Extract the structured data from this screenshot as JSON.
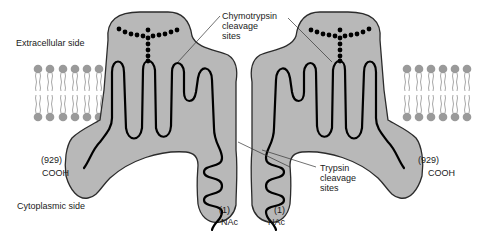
{
  "figure": {
    "labels": {
      "extracellular": "Extracellular side",
      "cytoplasmic": "Cytoplasmic side",
      "chymotrypsin_line1": "Chymotrypsin",
      "chymotrypsin_line2": "cleavage",
      "chymotrypsin_line3": "sites",
      "trypsin_line1": "Trypsin",
      "trypsin_line2": "cleavage",
      "trypsin_line3": "sites"
    },
    "left_protein": {
      "c_terminus_number": "(929)",
      "c_terminus": "COOH",
      "n_terminus_number": "(1)",
      "n_terminus": "NAc"
    },
    "right_protein": {
      "c_terminus_number": "(929)",
      "c_terminus": "COOH",
      "n_terminus_number": "(1)",
      "n_terminus": "NAc"
    },
    "membrane": {
      "left_lipid_count": 6,
      "right_lipid_count": 6
    },
    "colors": {
      "protein_fill": "#b8b8b8",
      "chain": "#000000",
      "lipid_head": "#9a9a9a"
    }
  }
}
